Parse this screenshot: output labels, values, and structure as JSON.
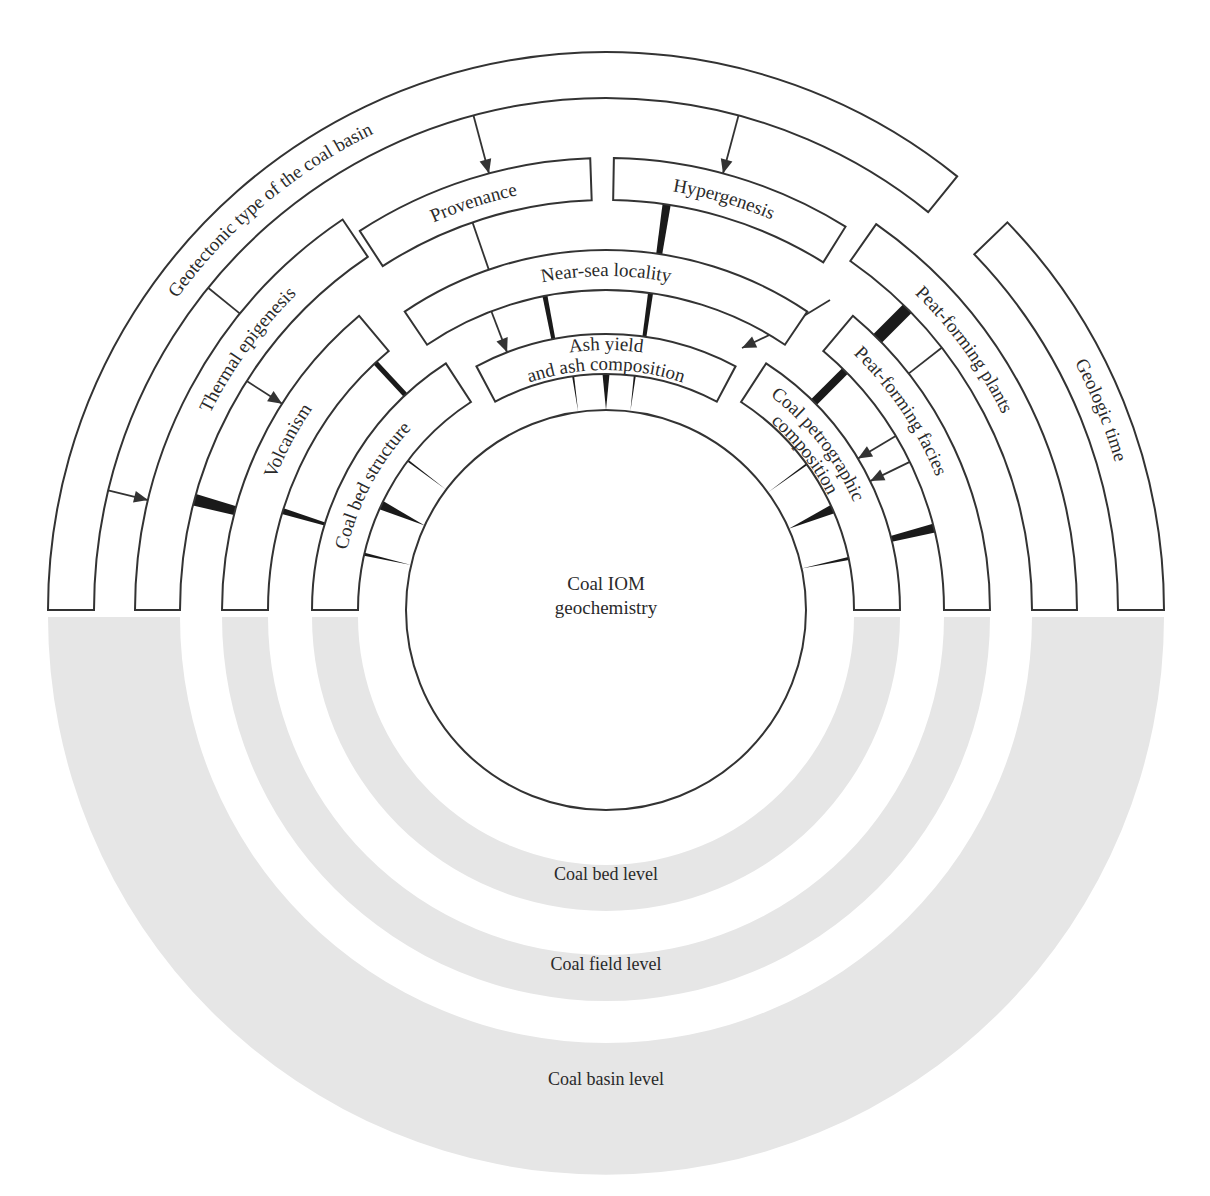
{
  "diagram": {
    "center": {
      "x": 606,
      "y": 610
    },
    "band_center": {
      "x": 606,
      "y": 617
    },
    "core": {
      "radius": 200,
      "label_line1": "Coal IOM",
      "label_line2": "geochemistry"
    },
    "segments": [
      {
        "id": "geotectonic",
        "label": "Geotectonic type of the coal basin",
        "r1": 512,
        "r2": 558,
        "a1": 180,
        "a2": 51,
        "label_r": 530,
        "label_a": 130,
        "side": "left"
      },
      {
        "id": "geologic-time",
        "label": "Geologic time",
        "r1": 512,
        "r2": 558,
        "a1": 44,
        "a2": 0,
        "label_r": 530,
        "label_a": 22,
        "side": "right"
      },
      {
        "id": "provenance",
        "label": "Provenance",
        "r1": 410,
        "r2": 452,
        "a1": 123,
        "a2": 92,
        "label_r": 424,
        "label_a": 108,
        "side": "left"
      },
      {
        "id": "hypergenesis",
        "label": "Hypergenesis",
        "r1": 410,
        "r2": 452,
        "a1": 89,
        "a2": 58,
        "label_r": 424,
        "label_a": 74,
        "side": "right"
      },
      {
        "id": "thermal-epigenesis",
        "label": "Thermal epigenesis",
        "r1": 426,
        "r2": 471,
        "a1": 180,
        "a2": 124,
        "label_r": 442,
        "label_a": 144,
        "side": "left"
      },
      {
        "id": "peat-forming-plants",
        "label": "Peat-forming plants",
        "r1": 426,
        "r2": 471,
        "a1": 55,
        "a2": 0,
        "label_r": 442,
        "label_a": 36,
        "side": "right"
      },
      {
        "id": "near-sea-locality",
        "label": "Near-sea locality",
        "r1": 320,
        "r2": 360,
        "a1": 124,
        "a2": 56,
        "label_r": 334,
        "label_a": 90,
        "side": "left"
      },
      {
        "id": "volcanism",
        "label": "Volcanism",
        "r1": 338,
        "r2": 384,
        "a1": 180,
        "a2": 130,
        "label_r": 356,
        "label_a": 152,
        "side": "left"
      },
      {
        "id": "peat-forming-facies",
        "label": "Peat-forming facies",
        "r1": 338,
        "r2": 384,
        "a1": 50,
        "a2": 0,
        "label_r": 356,
        "label_a": 34,
        "side": "right"
      },
      {
        "id": "ash-yield",
        "label": "Ash yield",
        "label2": "and ash composition",
        "r1": 236,
        "r2": 276,
        "a1": 118,
        "a2": 62,
        "label_r": 260,
        "label_a": 90,
        "side": "left"
      },
      {
        "id": "coal-bed-structure",
        "label": "Coal bed structure",
        "r1": 248,
        "r2": 294,
        "a1": 180,
        "a2": 123,
        "label_r": 266,
        "label_a": 152,
        "side": "left"
      },
      {
        "id": "coal-petrographic",
        "label": "Coal petrographic",
        "label2": "composition",
        "r1": 248,
        "r2": 294,
        "a1": 57,
        "a2": 0,
        "label_r": 270,
        "label_a": 38,
        "side": "right"
      }
    ],
    "levels": [
      {
        "id": "coal-basin-level",
        "label": "Coal basin level",
        "r1": 426,
        "r2": 558,
        "label_y": 1085
      },
      {
        "id": "coal-field-level",
        "label": "Coal field level",
        "r1": 338,
        "r2": 384,
        "label_y": 970
      },
      {
        "id": "coal-bed-level",
        "label": "Coal bed level",
        "r1": 248,
        "r2": 294,
        "label_y": 880
      }
    ],
    "wedges": [
      {
        "a": 81.5,
        "r_from": 452,
        "r_to": 360,
        "w_outer": 10,
        "w_inner": 6
      },
      {
        "a": 101,
        "r_from": 320,
        "r_to": 276,
        "w_outer": 5,
        "w_inner": 4
      },
      {
        "a": 82,
        "r_from": 320,
        "r_to": 276,
        "w_outer": 5,
        "w_inner": 4
      },
      {
        "a": 90,
        "r_from": 236,
        "r_to": 200,
        "w_outer": 7,
        "w_inner": 0
      },
      {
        "a": 98,
        "r_from": 236,
        "r_to": 200,
        "w_outer": 2,
        "w_inner": 0
      },
      {
        "a": 83,
        "r_from": 236,
        "r_to": 200,
        "w_outer": 2,
        "w_inner": 0
      },
      {
        "a": 165,
        "r_from": 426,
        "r_to": 384,
        "w_outer": 12,
        "w_inner": 9
      },
      {
        "a": 163,
        "r_from": 338,
        "r_to": 294,
        "w_outer": 6,
        "w_inner": 3
      },
      {
        "a": 133,
        "r_from": 338,
        "r_to": 294,
        "w_outer": 5,
        "w_inner": 5
      },
      {
        "a": 143,
        "r_from": 248,
        "r_to": 200,
        "w_outer": 2,
        "w_inner": 0
      },
      {
        "a": 155,
        "r_from": 248,
        "r_to": 200,
        "w_outer": 9,
        "w_inner": 0
      },
      {
        "a": 167,
        "r_from": 248,
        "r_to": 200,
        "w_outer": 3,
        "w_inner": 0
      },
      {
        "a": 45,
        "r_from": 426,
        "r_to": 384,
        "w_outer": 12,
        "w_inner": 12
      },
      {
        "a": 45,
        "r_from": 338,
        "r_to": 294,
        "w_outer": 8,
        "w_inner": 8
      },
      {
        "a": 14,
        "r_from": 338,
        "r_to": 294,
        "w_outer": 9,
        "w_inner": 6
      },
      {
        "a": 36,
        "r_from": 248,
        "r_to": 200,
        "w_outer": 2,
        "w_inner": 0
      },
      {
        "a": 24,
        "r_from": 248,
        "r_to": 200,
        "w_outer": 9,
        "w_inner": 0
      },
      {
        "a": 12,
        "r_from": 248,
        "r_to": 200,
        "w_outer": 3,
        "w_inner": 0
      }
    ],
    "links": [
      {
        "type": "arrow",
        "a": 105,
        "r_from": 512,
        "r_to": 452
      },
      {
        "type": "arrow",
        "a": 75,
        "r_from": 512,
        "r_to": 452
      },
      {
        "type": "line",
        "a": 109,
        "r_from": 410,
        "r_to": 360
      },
      {
        "type": "arrow",
        "a": 111,
        "r_from": 320,
        "r_to": 276
      },
      {
        "type": "line",
        "a": 141,
        "r_from": 512,
        "r_to": 471
      },
      {
        "type": "arrow",
        "a": 166.5,
        "r_from": 512,
        "r_to": 471
      },
      {
        "type": "arrow",
        "a": 147.5,
        "r_from": 426,
        "r_to": 384
      },
      {
        "type": "line",
        "a": 38,
        "r_from": 426,
        "r_to": 384
      },
      {
        "type": "arrow",
        "a": 31,
        "r_from": 338,
        "r_to": 294
      },
      {
        "type": "arrow",
        "a": 26,
        "r_from": 338,
        "r_to": 294
      }
    ],
    "bent_arrow": {
      "from": {
        "x": 784,
        "y": 328
      },
      "to": {
        "x": 742,
        "y": 348
      }
    }
  }
}
